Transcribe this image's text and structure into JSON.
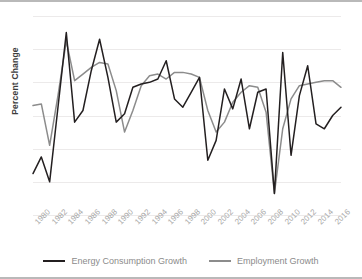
{
  "chart_data": {
    "type": "line",
    "title": "",
    "xlabel": "",
    "ylabel": "Percent Change",
    "ylim": [
      -6,
      6
    ],
    "yticks": [
      6,
      4,
      2,
      0,
      -2,
      -4,
      -6
    ],
    "xlim": [
      1980,
      2017
    ],
    "xticks": [
      "1980",
      "1982",
      "1984",
      "1986",
      "1988",
      "1990",
      "1992",
      "1994",
      "1996",
      "1998",
      "2000",
      "2002",
      "2004",
      "2006",
      "2008",
      "2010",
      "2012",
      "2014",
      "2016"
    ],
    "grid": true,
    "legend_position": "bottom",
    "x": [
      1980,
      1981,
      1982,
      1983,
      1984,
      1985,
      1986,
      1987,
      1988,
      1989,
      1990,
      1991,
      1992,
      1993,
      1994,
      1995,
      1996,
      1997,
      1998,
      1999,
      2000,
      2001,
      2002,
      2003,
      2004,
      2005,
      2006,
      2007,
      2008,
      2009,
      2010,
      2011,
      2012,
      2013,
      2014,
      2015,
      2016,
      2017
    ],
    "series": [
      {
        "name": "Energy Consumption Growth",
        "color": "#231f20",
        "values": [
          -3.5,
          -2.5,
          -4.0,
          0.5,
          5.0,
          -0.4,
          0.3,
          2.7,
          4.6,
          2.3,
          -0.4,
          0.1,
          1.7,
          1.9,
          2.0,
          2.2,
          3.3,
          1.0,
          0.5,
          1.4,
          2.3,
          -2.7,
          -1.5,
          1.6,
          0.4,
          2.2,
          -0.8,
          1.4,
          1.6,
          -4.7,
          3.8,
          -2.4,
          1.2,
          3.0,
          -0.5,
          -0.8,
          0.0,
          0.5
        ]
      },
      {
        "name": "Employment Growth",
        "color": "#8c8c8c",
        "values": [
          0.6,
          0.7,
          -1.8,
          1.2,
          4.5,
          2.1,
          2.5,
          2.9,
          3.2,
          3.1,
          1.5,
          -1.0,
          0.3,
          1.8,
          2.4,
          2.5,
          2.2,
          2.6,
          2.6,
          2.5,
          2.3,
          0.3,
          -1.0,
          -0.4,
          0.8,
          1.4,
          1.8,
          1.7,
          0.2,
          -4.7,
          -0.8,
          1.0,
          1.8,
          1.9,
          2.0,
          2.1,
          2.1,
          1.7
        ]
      }
    ]
  },
  "legend": {
    "items": [
      {
        "label": "Energy Consumption Growth",
        "color": "#231f20"
      },
      {
        "label": "Employment Growth",
        "color": "#8c8c8c"
      }
    ]
  }
}
